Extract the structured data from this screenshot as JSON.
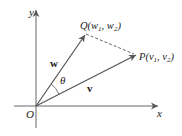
{
  "diagram": {
    "axes": {
      "x_label": "x",
      "y_label": "y",
      "origin_label": "O"
    },
    "points": {
      "Q": {
        "name": "Q",
        "sub1": "w",
        "i1": "1",
        "sub2": "w",
        "i2": "2"
      },
      "P": {
        "name": "P",
        "sub1": "v",
        "i1": "1",
        "sub2": "v",
        "i2": "2"
      }
    },
    "vectors": {
      "w": "w",
      "v": "v"
    },
    "angle_label": "θ",
    "colors": {
      "ink": "#222222",
      "axis": "#555555",
      "arrow": "#555555"
    }
  }
}
